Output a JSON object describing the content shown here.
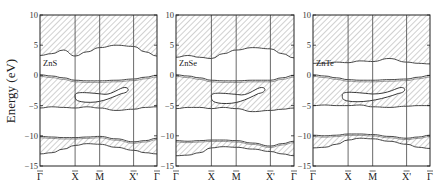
{
  "chart_data": {
    "type": "area",
    "title": "",
    "ylabel": "Energy (eV)",
    "xlabel": "",
    "ylim": [
      -15,
      10
    ],
    "yticks": [
      10,
      5,
      0,
      -5,
      -10,
      -15
    ],
    "kpoint_labels": [
      "Γ̄",
      "X̄",
      "M̄",
      "X̄'",
      "Γ̄"
    ],
    "kpoint_positions": [
      0,
      0.3,
      0.51,
      0.8,
      1.0
    ],
    "grid": false,
    "legend": null,
    "note": "Projected bulk band structure (hatched = bulk bands) for three II-VI compounds; curves are approximate band edges in eV vs. normalized k-path position.",
    "panels": [
      {
        "material": "ZnS",
        "x": [
          0,
          0.1,
          0.2,
          0.3,
          0.4,
          0.51,
          0.65,
          0.8,
          0.9,
          1.0
        ],
        "conduction_band_bottom": [
          3.3,
          3.6,
          4.2,
          3.2,
          3.9,
          4.6,
          5.0,
          4.8,
          3.9,
          3.2
        ],
        "valence_band_top": [
          0.1,
          -0.1,
          -0.4,
          -0.8,
          -0.9,
          -0.9,
          -0.8,
          -0.6,
          -0.3,
          0.0
        ],
        "valence_band_bottom": [
          -5.4,
          -5.2,
          -5.3,
          -5.4,
          -5.2,
          -5.4,
          -5.8,
          -5.6,
          -5.3,
          -5.2
        ],
        "surface_state_pocket": {
          "x_range": [
            0.3,
            0.75
          ],
          "E_range": [
            -4.6,
            -2.0
          ]
        },
        "lower_band_top": [
          -10.1,
          -10.2,
          -10.3,
          -10.3,
          -10.2,
          -10.1,
          -10.5,
          -11.0,
          -10.8,
          -10.4
        ],
        "lower_band_bottom": [
          -13.0,
          -12.8,
          -12.2,
          -11.6,
          -11.3,
          -11.4,
          -11.9,
          -12.4,
          -12.8,
          -13.0
        ]
      },
      {
        "material": "ZnSe",
        "x": [
          0,
          0.1,
          0.2,
          0.3,
          0.4,
          0.51,
          0.65,
          0.8,
          0.9,
          1.0
        ],
        "conduction_band_bottom": [
          3.0,
          3.3,
          3.0,
          2.8,
          3.6,
          4.2,
          4.6,
          4.4,
          3.6,
          2.9
        ],
        "valence_band_top": [
          0.1,
          -0.1,
          -0.4,
          -0.8,
          -0.9,
          -0.9,
          -0.8,
          -0.8,
          -0.4,
          0.0
        ],
        "valence_band_bottom": [
          -5.5,
          -5.3,
          -5.3,
          -5.5,
          -5.3,
          -5.5,
          -6.0,
          -5.8,
          -5.6,
          -5.4
        ],
        "surface_state_pocket": {
          "x_range": [
            0.3,
            0.75
          ],
          "E_range": [
            -4.8,
            -2.0
          ]
        },
        "lower_band_top": [
          -10.8,
          -10.9,
          -10.8,
          -10.7,
          -10.7,
          -10.8,
          -11.2,
          -11.7,
          -11.3,
          -10.9
        ],
        "lower_band_bottom": [
          -13.3,
          -13.2,
          -12.8,
          -12.0,
          -11.8,
          -11.9,
          -12.2,
          -12.6,
          -13.0,
          -13.3
        ]
      },
      {
        "material": "ZnTe",
        "x": [
          0,
          0.1,
          0.2,
          0.3,
          0.4,
          0.51,
          0.65,
          0.8,
          0.9,
          1.0
        ],
        "conduction_band_bottom": [
          2.0,
          2.0,
          2.2,
          2.1,
          2.4,
          2.3,
          2.8,
          2.2,
          2.0,
          1.9
        ],
        "valence_band_top": [
          0.1,
          -0.1,
          -0.4,
          -0.7,
          -0.8,
          -0.8,
          -0.7,
          -0.6,
          -0.3,
          0.0
        ],
        "valence_band_bottom": [
          -5.0,
          -4.9,
          -5.0,
          -5.0,
          -4.9,
          -5.2,
          -5.3,
          -5.1,
          -5.0,
          -5.0
        ],
        "surface_state_pocket": {
          "x_range": [
            0.25,
            0.78
          ],
          "E_range": [
            -4.5,
            -2.0
          ]
        },
        "lower_band_top": [
          -9.9,
          -10.0,
          -9.9,
          -9.7,
          -9.7,
          -9.8,
          -10.1,
          -10.4,
          -10.2,
          -9.9
        ],
        "lower_band_bottom": [
          -12.0,
          -11.9,
          -11.4,
          -10.7,
          -10.4,
          -10.5,
          -10.9,
          -11.4,
          -11.9,
          -12.1
        ]
      }
    ]
  },
  "axis": {
    "ylabel": "Energy (eV)",
    "yticks": [
      "10",
      "5",
      "0",
      "-5",
      "-10",
      "-15"
    ],
    "klabels": [
      "Γ",
      "X",
      "M",
      "X'",
      "Γ"
    ]
  },
  "panels": [
    {
      "material": "ZnS"
    },
    {
      "material": "ZnSe"
    },
    {
      "material": "ZnTe"
    }
  ]
}
